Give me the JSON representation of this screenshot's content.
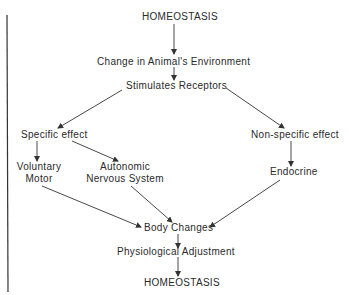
{
  "diagram": {
    "nodes": {
      "top_homeostasis": "HOMEOSTASIS",
      "change_environment": "Change in Animal's Environment",
      "stimulates_receptors": "Stimulates Receptors",
      "specific_effect": "Specific effect",
      "non_specific_effect": "Non-specific effect",
      "voluntary_motor_line1": "Voluntary",
      "voluntary_motor_line2": "Motor",
      "autonomic_line1": "Autonomic",
      "autonomic_line2": "Nervous System",
      "endocrine": "Endocrine",
      "body_changes": "Body Changes",
      "physiological_adjustment": "Physiological Adjustment",
      "bottom_homeostasis": "HOMEOSTASIS"
    },
    "edges": [
      {
        "from": "HOMEOSTASIS",
        "to": "Change in Animal's Environment"
      },
      {
        "from": "Change in Animal's Environment",
        "to": "Stimulates Receptors"
      },
      {
        "from": "Stimulates Receptors",
        "to": "Specific effect"
      },
      {
        "from": "Stimulates Receptors",
        "to": "Non-specific effect"
      },
      {
        "from": "Specific effect",
        "to": "Voluntary Motor"
      },
      {
        "from": "Specific effect",
        "to": "Autonomic Nervous System"
      },
      {
        "from": "Non-specific effect",
        "to": "Endocrine"
      },
      {
        "from": "Voluntary Motor",
        "to": "Body Changes"
      },
      {
        "from": "Autonomic Nervous System",
        "to": "Body Changes"
      },
      {
        "from": "Endocrine",
        "to": "Body Changes"
      },
      {
        "from": "Body Changes",
        "to": "Physiological Adjustment"
      },
      {
        "from": "Physiological Adjustment",
        "to": "HOMEOSTASIS"
      }
    ],
    "line_color": "#333333"
  }
}
